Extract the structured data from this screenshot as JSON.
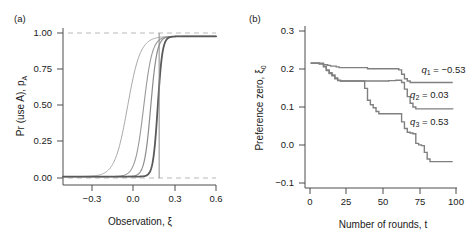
{
  "figure": {
    "background": "#ffffff",
    "panels": [
      "(a)",
      "(b)"
    ]
  },
  "panel_a": {
    "label": "(a)",
    "label_name": "panel-a-label"
  },
  "panel_b": {
    "label": "(b)",
    "label_name": "panel-b-label"
  },
  "chart_data": [
    {
      "type": "line",
      "panel": "(a)",
      "title": "",
      "xlabel": "Observation, ξ",
      "ylabel": "Pr (use A), p",
      "ylabel_sub": "A",
      "xlim": [
        -0.47,
        0.62
      ],
      "ylim": [
        -0.06,
        1.06
      ],
      "xticks": [
        -0.3,
        0.0,
        0.3,
        0.6
      ],
      "xticklabels": [
        "−0.3",
        "0.0",
        "0.3",
        "0.6"
      ],
      "yticks": [
        0.0,
        0.25,
        0.5,
        0.75,
        1.0
      ],
      "yticklabels": [
        "0.00",
        "0.25",
        "0.50",
        "0.75",
        "1.00"
      ],
      "grid": false,
      "legend": "none",
      "reference_lines": [
        {
          "kind": "hline",
          "y": 1.0,
          "style": "dashed",
          "color": "#b9b9b9"
        },
        {
          "kind": "hline",
          "y": 0.0,
          "style": "dashed",
          "color": "#b9b9b9"
        },
        {
          "kind": "vline",
          "x": 0.215,
          "style": "solid",
          "color": "#8a8a8a"
        }
      ],
      "series": [
        {
          "name": "logistic-1",
          "midpoint": -0.01,
          "slope": 22,
          "color": "#a8a8a8",
          "width": 1.0
        },
        {
          "name": "logistic-2",
          "midpoint": 0.105,
          "slope": 33,
          "color": "#9a9a9a",
          "width": 1.1
        },
        {
          "name": "logistic-3",
          "midpoint": 0.155,
          "slope": 45,
          "color": "#8c8c8c",
          "width": 1.2
        },
        {
          "name": "logistic-4",
          "midpoint": 0.205,
          "slope": 60,
          "color": "#5a5a5a",
          "width": 1.8
        }
      ]
    },
    {
      "type": "line",
      "panel": "(b)",
      "title": "",
      "xlabel": "Number of rounds, t",
      "ylabel": "Preference zero, ξ",
      "ylabel_sub": "0",
      "xlim": [
        -4,
        103
      ],
      "ylim": [
        -0.118,
        0.318
      ],
      "xticks": [
        0,
        25,
        50,
        75,
        100
      ],
      "xticklabels": [
        "0",
        "25",
        "50",
        "75",
        "100"
      ],
      "yticks": [
        -0.1,
        0.0,
        0.1,
        0.2,
        0.3
      ],
      "yticklabels": [
        "−0.1",
        "0.0",
        "0.1",
        "0.2",
        "0.3"
      ],
      "grid": false,
      "legend": "inline-annotations",
      "annotations": [
        {
          "text": "q",
          "sub": "1",
          "eq": " = −0.53",
          "x": 78,
          "y": 0.192,
          "name": "annotation-q1"
        },
        {
          "text": "q",
          "sub": "2",
          "eq": " = 0.03",
          "x": 70,
          "y": 0.125,
          "name": "annotation-q2"
        },
        {
          "text": "q",
          "sub": "3",
          "eq": " = 0.53",
          "x": 70,
          "y": 0.052,
          "name": "annotation-q3"
        }
      ],
      "series": [
        {
          "name": "q1",
          "label": "q1 = -0.53",
          "color": "#808080",
          "width": 1.4,
          "step": "post",
          "x": [
            0,
            6,
            9,
            12,
            14,
            16,
            18,
            20,
            40,
            62,
            64,
            66,
            68,
            70,
            100
          ],
          "y": [
            0.218,
            0.218,
            0.214,
            0.212,
            0.21,
            0.21,
            0.208,
            0.206,
            0.203,
            0.2,
            0.188,
            0.176,
            0.17,
            0.166,
            0.166
          ]
        },
        {
          "name": "q2",
          "label": "q2 = 0.03",
          "color": "#808080",
          "width": 1.4,
          "step": "post",
          "x": [
            0,
            6,
            9,
            11,
            13,
            15,
            17,
            19,
            21,
            40,
            55,
            60,
            64,
            66,
            68,
            70,
            72,
            74,
            100
          ],
          "y": [
            0.218,
            0.216,
            0.21,
            0.2,
            0.192,
            0.186,
            0.178,
            0.172,
            0.17,
            0.17,
            0.171,
            0.172,
            0.166,
            0.148,
            0.128,
            0.11,
            0.1,
            0.095,
            0.094
          ]
        },
        {
          "name": "q3",
          "label": "q3 = 0.53",
          "color": "#808080",
          "width": 1.4,
          "step": "post",
          "x": [
            0,
            6,
            9,
            11,
            13,
            15,
            17,
            19,
            21,
            36,
            38,
            40,
            42,
            44,
            46,
            48,
            62,
            64,
            66,
            68,
            70,
            72,
            74,
            76,
            78,
            80,
            82,
            84,
            100
          ],
          "y": [
            0.218,
            0.216,
            0.208,
            0.198,
            0.19,
            0.184,
            0.176,
            0.171,
            0.17,
            0.17,
            0.15,
            0.118,
            0.106,
            0.098,
            0.088,
            0.082,
            0.082,
            0.06,
            0.042,
            0.032,
            0.03,
            0.028,
            0.002,
            -0.002,
            -0.004,
            -0.022,
            -0.04,
            -0.047,
            -0.047
          ]
        }
      ]
    }
  ]
}
